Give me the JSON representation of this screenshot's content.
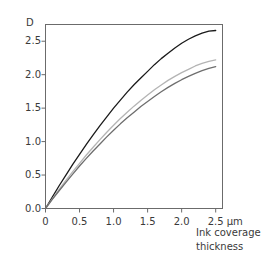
{
  "chart_data": {
    "type": "line",
    "title": "",
    "xlabel": "Ink coverage thickness",
    "xunit": "µm",
    "ylabel": "D",
    "xlim": [
      0,
      2.6
    ],
    "ylim": [
      0,
      2.75
    ],
    "grid": false,
    "legend": "none",
    "xticks": [
      "0",
      "0.5",
      "1.0",
      "1.5",
      "2.0",
      "2.5"
    ],
    "xtick_values": [
      0,
      0.5,
      1.0,
      1.5,
      2.0,
      2.5
    ],
    "yticks": [
      "0.0",
      "0.5",
      "1.0",
      "1.5",
      "2.0",
      "2.5"
    ],
    "ytick_values": [
      0.0,
      0.5,
      1.0,
      1.5,
      2.0,
      2.5
    ],
    "x": [
      0,
      0.1,
      0.2,
      0.3,
      0.4,
      0.5,
      0.6,
      0.7,
      0.8,
      0.9,
      1.0,
      1.1,
      1.2,
      1.3,
      1.4,
      1.5,
      1.6,
      1.7,
      1.8,
      1.9,
      2.0,
      2.1,
      2.2,
      2.3,
      2.4,
      2.5
    ],
    "series": [
      {
        "name": "black-ink-curve",
        "color": "#1a1a1a",
        "values": [
          0.0,
          0.17,
          0.34,
          0.5,
          0.66,
          0.81,
          0.96,
          1.1,
          1.24,
          1.37,
          1.5,
          1.62,
          1.74,
          1.85,
          1.95,
          2.05,
          2.15,
          2.24,
          2.32,
          2.4,
          2.47,
          2.53,
          2.58,
          2.62,
          2.65,
          2.66
        ]
      },
      {
        "name": "light-gray-ink-curve",
        "color": "#b4b4b4",
        "values": [
          0.0,
          0.145,
          0.285,
          0.42,
          0.55,
          0.675,
          0.8,
          0.915,
          1.03,
          1.14,
          1.245,
          1.345,
          1.44,
          1.53,
          1.615,
          1.695,
          1.775,
          1.845,
          1.915,
          1.975,
          2.03,
          2.08,
          2.13,
          2.17,
          2.2,
          2.22
        ]
      },
      {
        "name": "mid-gray-ink-curve",
        "color": "#6e6e6e",
        "values": [
          0.0,
          0.135,
          0.265,
          0.39,
          0.515,
          0.635,
          0.75,
          0.86,
          0.965,
          1.07,
          1.17,
          1.265,
          1.355,
          1.44,
          1.525,
          1.6,
          1.675,
          1.745,
          1.81,
          1.87,
          1.925,
          1.975,
          2.02,
          2.06,
          2.095,
          2.12
        ]
      }
    ]
  },
  "axis": {
    "y_unit_label": "D",
    "x_title_line1": "Ink coverage",
    "x_title_line2": "thickness",
    "x_unit_label": "µm"
  },
  "colors": {
    "axis": "#6b6b6b",
    "text": "#3a3a3a",
    "background": "#ffffff"
  }
}
